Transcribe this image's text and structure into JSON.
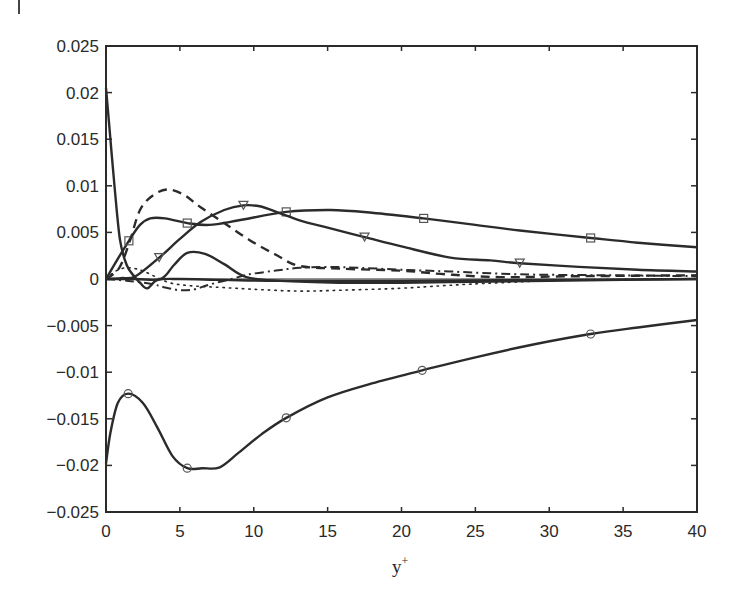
{
  "chart_data": {
    "type": "line",
    "title": "",
    "xlabel": "y+",
    "ylabel": "",
    "xlim": [
      0,
      40
    ],
    "ylim": [
      -0.025,
      0.025
    ],
    "grid": false,
    "legend": "none",
    "x_ticks": [
      "0",
      "5",
      "10",
      "15",
      "20",
      "25",
      "30",
      "35",
      "40"
    ],
    "y_ticks": [
      "0.025",
      "0.02",
      "0.015",
      "0.01",
      "0.005",
      "0",
      "−0.005",
      "−0.01",
      "−0.015",
      "−0.02",
      "−0.025"
    ],
    "zero_line": true,
    "series": [
      {
        "name": "solid-circle",
        "style": "solid",
        "marker": "circle",
        "x": [
          0,
          0.3,
          0.8,
          1.5,
          2.5,
          3.5,
          4.5,
          5.5,
          6.5,
          7.7,
          9,
          10.5,
          12.2,
          15,
          18,
          21.4,
          25,
          29,
          32.8,
          36,
          40
        ],
        "y": [
          -0.0198,
          -0.0165,
          -0.0133,
          -0.0123,
          -0.0133,
          -0.016,
          -0.019,
          -0.0203,
          -0.0203,
          -0.0202,
          -0.0186,
          -0.0167,
          -0.0149,
          -0.0127,
          -0.0112,
          -0.0098,
          -0.0084,
          -0.007,
          -0.0059,
          -0.0052,
          -0.0044
        ],
        "markers_x": [
          1.5,
          5.5,
          12.2,
          21.4,
          32.8
        ]
      },
      {
        "name": "solid-square",
        "style": "solid",
        "marker": "square",
        "x": [
          0,
          0.7,
          1.55,
          2.3,
          3,
          4,
          5.5,
          7,
          9,
          12.2,
          15.2,
          18,
          21.5,
          25,
          28,
          32.8,
          36,
          40
        ],
        "y": [
          0,
          0.0019,
          0.0041,
          0.0058,
          0.0065,
          0.0065,
          0.006,
          0.0058,
          0.0063,
          0.0072,
          0.0074,
          0.0071,
          0.0065,
          0.0058,
          0.0052,
          0.0044,
          0.0039,
          0.0034
        ],
        "markers_x": [
          1.55,
          5.5,
          12.2,
          21.5,
          32.8
        ]
      },
      {
        "name": "solid-triangle",
        "style": "solid",
        "marker": "triangle-down",
        "x": [
          0,
          1,
          2,
          3.6,
          5,
          6.4,
          8,
          9.3,
          10.4,
          11.7,
          13.1,
          15,
          17.5,
          20,
          23.3,
          26,
          28,
          32,
          36,
          40
        ],
        "y": [
          0,
          0.0001,
          0.0003,
          0.0023,
          0.0043,
          0.0061,
          0.0074,
          0.0079,
          0.0078,
          0.0071,
          0.0063,
          0.0055,
          0.0045,
          0.0035,
          0.0023,
          0.002,
          0.0017,
          0.0013,
          0.001,
          0.0008
        ],
        "markers_x": [
          3.6,
          9.3,
          17.5,
          28
        ]
      },
      {
        "name": "solid-steep",
        "style": "solid",
        "marker": "none",
        "x": [
          0,
          0.3,
          0.6,
          0.95,
          1.4,
          1.9,
          2.3,
          2.8,
          3.5,
          5,
          8,
          12,
          20,
          30,
          40
        ],
        "y": [
          0.0205,
          0.015,
          0.0095,
          0.0042,
          0.0015,
          0.0003,
          -0.0004,
          -0.001,
          -0.0001,
          0.0,
          -0.0001,
          -0.0002,
          -0.0002,
          -0.0001,
          0.0
        ]
      },
      {
        "name": "solid-bump",
        "style": "solid",
        "marker": "none",
        "x": [
          0,
          2,
          3.7,
          4.6,
          5.5,
          6.7,
          8,
          9.5,
          11.8,
          15.8,
          20,
          25,
          30,
          35,
          40
        ],
        "y": [
          0,
          0.0,
          0.0,
          0.0015,
          0.0028,
          0.0027,
          0.0016,
          0.0002,
          -0.0002,
          -0.0004,
          -0.0004,
          -0.0003,
          -0.0002,
          -0.0001,
          0.0
        ]
      },
      {
        "name": "dashed",
        "style": "dashed",
        "marker": "none",
        "x": [
          0,
          0.9,
          1.6,
          2.3,
          3.2,
          4.2,
          5.3,
          6.4,
          8,
          9.7,
          11.5,
          13.1,
          16,
          19.9,
          23,
          26.7,
          32,
          40
        ],
        "y": [
          0,
          0.0012,
          0.004,
          0.0074,
          0.009,
          0.0096,
          0.009,
          0.0077,
          0.006,
          0.0042,
          0.0026,
          0.0014,
          0.0011,
          0.0009,
          0.0005,
          0.0002,
          0.0003,
          0.0004
        ]
      },
      {
        "name": "dash-dot",
        "style": "dash-dot",
        "marker": "none",
        "x": [
          0,
          1.5,
          3,
          4,
          5,
          6,
          7,
          8.5,
          9.7,
          11.5,
          13.1,
          15,
          17.2,
          20,
          23.3,
          28,
          34,
          40
        ],
        "y": [
          0,
          -0.0002,
          -0.0005,
          -0.0009,
          -0.0012,
          -0.0011,
          -0.0006,
          0.0,
          0.0005,
          0.0009,
          0.0012,
          0.0013,
          0.0012,
          0.001,
          0.0008,
          0.0005,
          0.0004,
          0.0003
        ]
      },
      {
        "name": "dotted",
        "style": "dotted",
        "marker": "none",
        "x": [
          0,
          0.6,
          1.3,
          2,
          2.6,
          3.4,
          4.3,
          5.5,
          7.7,
          10,
          13.1,
          16,
          19.9,
          23,
          26.7,
          32,
          40
        ],
        "y": [
          0,
          0.0008,
          0.0012,
          0.0011,
          0.0008,
          0.0002,
          -0.0004,
          -0.0007,
          -0.0009,
          -0.0011,
          -0.0013,
          -0.0012,
          -0.001,
          -0.0007,
          -0.0004,
          -0.0001,
          0.0
        ]
      }
    ]
  },
  "axes": {
    "x_label": "y",
    "x_label_sup": "+"
  },
  "colors": {
    "line": "#2b2b2b",
    "axis": "#2b2b2b",
    "background": "#ffffff"
  }
}
